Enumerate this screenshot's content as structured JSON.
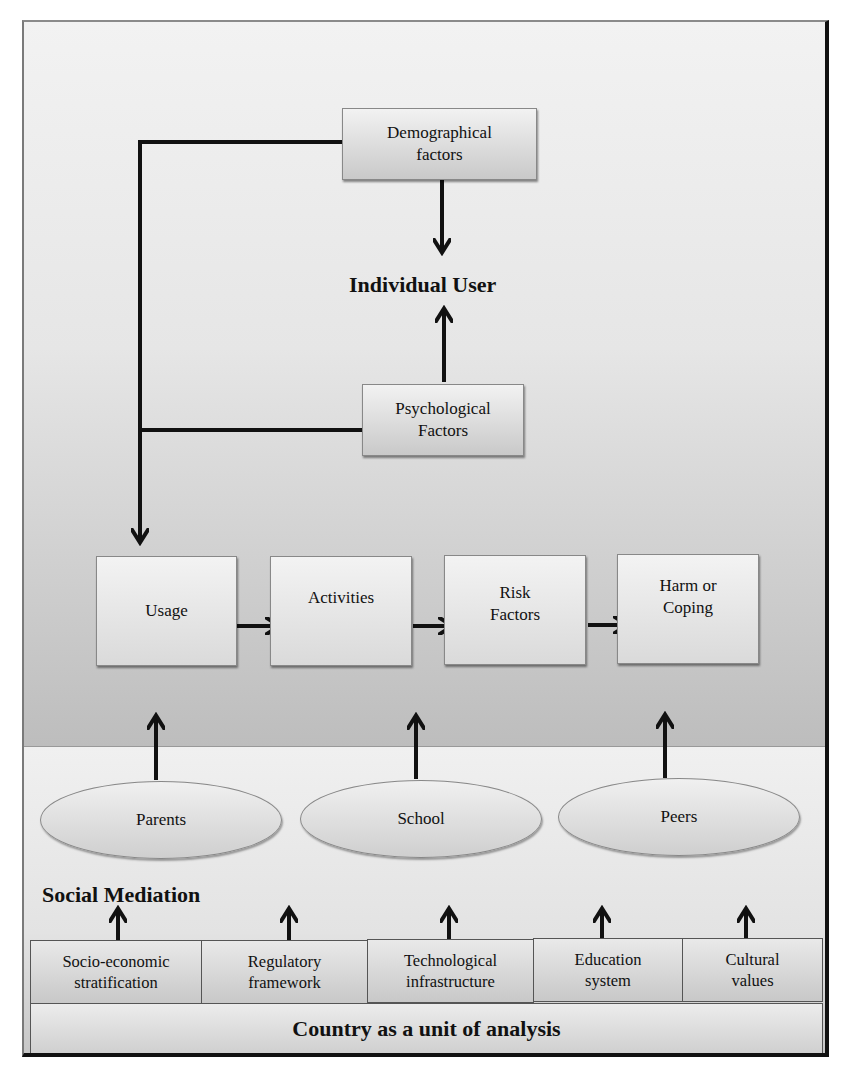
{
  "diagram": {
    "top": {
      "demographical": "Demographical factors",
      "demographical_lines": [
        "Demographical",
        "factors"
      ],
      "individual_user": "Individual User",
      "psychological_lines": [
        "Psychological",
        "Factors"
      ]
    },
    "flow": [
      {
        "lines": [
          "Usage"
        ]
      },
      {
        "lines": [
          "Activities"
        ]
      },
      {
        "lines": [
          "Risk",
          "Factors"
        ]
      },
      {
        "lines": [
          "Harm or",
          "Coping"
        ]
      }
    ],
    "mediators": [
      "Parents",
      "School",
      "Peers"
    ],
    "social_mediation_label": "Social Mediation",
    "country_factors": [
      {
        "lines": [
          "Socio-economic",
          "stratification"
        ]
      },
      {
        "lines": [
          "Regulatory",
          "framework"
        ]
      },
      {
        "lines": [
          "Technological",
          "infrastructure"
        ]
      },
      {
        "lines": [
          "Education",
          "system"
        ]
      },
      {
        "lines": [
          "Cultural",
          "values"
        ]
      }
    ],
    "country_label": "Country as a unit of analysis",
    "colors": {
      "line": "#111111",
      "box_top": "#f2f2f2",
      "box_bottom": "#c9c9c9",
      "upper_bg_bottom": "#bdbdbd",
      "frame_dark": "#111111"
    }
  }
}
